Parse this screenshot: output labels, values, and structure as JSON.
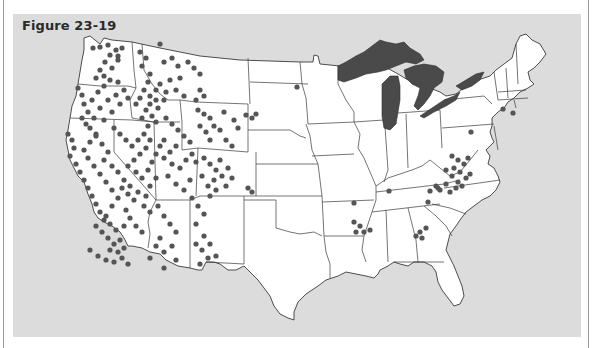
{
  "figure": {
    "title": "Figure 23-19"
  },
  "map": {
    "type": "dot-density map",
    "region": "Contiguous United States",
    "colors": {
      "panel_background": "#dcdcdc",
      "land": "#ffffff",
      "borders": "#3a3a3a",
      "great_lakes": "#4a4a4a",
      "dots": "#555555"
    },
    "great_lakes": [
      "Lake Superior",
      "Lake Michigan",
      "Lake Huron",
      "Lake Erie",
      "Lake Ontario"
    ],
    "dot_clusters": [
      {
        "region": "Washington",
        "points": [
          [
            93,
            48
          ],
          [
            100,
            47
          ],
          [
            108,
            45
          ],
          [
            116,
            50
          ],
          [
            110,
            55
          ],
          [
            118,
            56
          ],
          [
            105,
            62
          ],
          [
            112,
            68
          ],
          [
            118,
            60
          ],
          [
            122,
            48
          ],
          [
            100,
            70
          ],
          [
            96,
            78
          ],
          [
            104,
            76
          ]
        ]
      },
      {
        "region": "Oregon",
        "points": [
          [
            78,
            88
          ],
          [
            82,
            95
          ],
          [
            84,
            104
          ],
          [
            88,
            112
          ],
          [
            82,
            118
          ],
          [
            86,
            124
          ],
          [
            92,
            100
          ],
          [
            98,
            92
          ],
          [
            104,
            86
          ],
          [
            110,
            80
          ],
          [
            118,
            82
          ],
          [
            124,
            90
          ],
          [
            116,
            95
          ],
          [
            108,
            100
          ],
          [
            100,
            108
          ],
          [
            94,
            118
          ],
          [
            90,
            128
          ],
          [
            96,
            134
          ],
          [
            104,
            120
          ],
          [
            112,
            112
          ],
          [
            120,
            104
          ],
          [
            128,
            98
          ]
        ]
      },
      {
        "region": "Idaho",
        "points": [
          [
            140,
            52
          ],
          [
            146,
            58
          ],
          [
            142,
            66
          ],
          [
            150,
            74
          ],
          [
            148,
            82
          ],
          [
            144,
            90
          ],
          [
            150,
            96
          ],
          [
            156,
            90
          ],
          [
            160,
            84
          ],
          [
            156,
            100
          ],
          [
            150,
            104
          ],
          [
            146,
            110
          ],
          [
            152,
            116
          ],
          [
            158,
            108
          ],
          [
            164,
            100
          ],
          [
            140,
            98
          ],
          [
            136,
            104
          ],
          [
            142,
            118
          ],
          [
            156,
            122
          ],
          [
            148,
            126
          ]
        ]
      },
      {
        "region": "Montana",
        "points": [
          [
            160,
            44
          ],
          [
            164,
            62
          ],
          [
            172,
            58
          ],
          [
            178,
            66
          ],
          [
            188,
            62
          ],
          [
            194,
            68
          ],
          [
            200,
            74
          ],
          [
            180,
            78
          ],
          [
            170,
            80
          ],
          [
            176,
            90
          ],
          [
            184,
            96
          ],
          [
            166,
            92
          ],
          [
            200,
            90
          ],
          [
            204,
            96
          ],
          [
            196,
            100
          ]
        ]
      },
      {
        "region": "Wyoming",
        "points": [
          [
            198,
            110
          ],
          [
            204,
            114
          ],
          [
            210,
            118
          ],
          [
            214,
            126
          ],
          [
            220,
            130
          ],
          [
            206,
            132
          ],
          [
            200,
            126
          ],
          [
            224,
            112
          ],
          [
            234,
            120
          ],
          [
            238,
            128
          ],
          [
            226,
            140
          ],
          [
            232,
            146
          ],
          [
            210,
            140
          ]
        ]
      },
      {
        "region": "California",
        "points": [
          [
            68,
            134
          ],
          [
            72,
            140
          ],
          [
            74,
            148
          ],
          [
            70,
            156
          ],
          [
            76,
            164
          ],
          [
            80,
            172
          ],
          [
            84,
            180
          ],
          [
            88,
            188
          ],
          [
            92,
            196
          ],
          [
            96,
            204
          ],
          [
            100,
            212
          ],
          [
            104,
            220
          ],
          [
            96,
            226
          ],
          [
            102,
            232
          ],
          [
            108,
            238
          ],
          [
            114,
            244
          ],
          [
            110,
            250
          ],
          [
            118,
            252
          ],
          [
            124,
            248
          ],
          [
            120,
            240
          ],
          [
            116,
            230
          ],
          [
            110,
            224
          ],
          [
            106,
            216
          ],
          [
            112,
            206
          ],
          [
            118,
            198
          ],
          [
            112,
            190
          ],
          [
            106,
            182
          ],
          [
            100,
            174
          ],
          [
            94,
            166
          ],
          [
            88,
            158
          ],
          [
            84,
            150
          ],
          [
            90,
            142
          ],
          [
            96,
            136
          ],
          [
            102,
            144
          ],
          [
            108,
            152
          ],
          [
            104,
            160
          ],
          [
            112,
            166
          ],
          [
            118,
            172
          ],
          [
            124,
            180
          ],
          [
            122,
            188
          ],
          [
            128,
            194
          ],
          [
            134,
            200
          ],
          [
            126,
            210
          ],
          [
            130,
            218
          ],
          [
            136,
            226
          ],
          [
            142,
            232
          ],
          [
            124,
            226
          ],
          [
            90,
            250
          ],
          [
            98,
            256
          ],
          [
            106,
            260
          ],
          [
            114,
            262
          ],
          [
            122,
            258
          ],
          [
            128,
            264
          ]
        ]
      },
      {
        "region": "Nevada",
        "points": [
          [
            114,
            128
          ],
          [
            120,
            134
          ],
          [
            126,
            140
          ],
          [
            132,
            146
          ],
          [
            138,
            140
          ],
          [
            144,
            134
          ],
          [
            150,
            140
          ],
          [
            146,
            148
          ],
          [
            140,
            154
          ],
          [
            134,
            160
          ],
          [
            128,
            166
          ],
          [
            136,
            172
          ],
          [
            142,
            178
          ],
          [
            148,
            170
          ],
          [
            152,
            162
          ],
          [
            156,
            154
          ],
          [
            160,
            146
          ],
          [
            164,
            140
          ],
          [
            130,
            186
          ],
          [
            138,
            192
          ],
          [
            146,
            196
          ],
          [
            150,
            186
          ],
          [
            156,
            178
          ],
          [
            144,
            206
          ]
        ]
      },
      {
        "region": "Utah",
        "points": [
          [
            166,
            118
          ],
          [
            172,
            124
          ],
          [
            178,
            130
          ],
          [
            184,
            136
          ],
          [
            190,
            142
          ],
          [
            176,
            146
          ],
          [
            170,
            152
          ],
          [
            164,
            158
          ],
          [
            172,
            164
          ],
          [
            180,
            168
          ],
          [
            186,
            160
          ],
          [
            192,
            154
          ],
          [
            196,
            162
          ],
          [
            168,
            176
          ],
          [
            176,
            184
          ],
          [
            184,
            190
          ],
          [
            190,
            180
          ]
        ]
      },
      {
        "region": "Colorado",
        "points": [
          [
            204,
            158
          ],
          [
            210,
            164
          ],
          [
            216,
            170
          ],
          [
            222,
            176
          ],
          [
            214,
            180
          ],
          [
            208,
            186
          ],
          [
            202,
            176
          ],
          [
            220,
            160
          ],
          [
            228,
            168
          ],
          [
            232,
            178
          ],
          [
            226,
            186
          ],
          [
            216,
            190
          ],
          [
            210,
            196
          ],
          [
            248,
            188
          ],
          [
            252,
            192
          ]
        ]
      },
      {
        "region": "Arizona",
        "points": [
          [
            150,
            212
          ],
          [
            158,
            206
          ],
          [
            164,
            216
          ],
          [
            170,
            224
          ],
          [
            176,
            232
          ],
          [
            160,
            238
          ],
          [
            156,
            246
          ],
          [
            164,
            252
          ],
          [
            172,
            246
          ],
          [
            176,
            260
          ],
          [
            164,
            268
          ],
          [
            150,
            258
          ]
        ]
      },
      {
        "region": "New Mexico",
        "points": [
          [
            192,
            198
          ],
          [
            198,
            206
          ],
          [
            204,
            214
          ],
          [
            196,
            224
          ],
          [
            204,
            236
          ],
          [
            210,
            244
          ],
          [
            202,
            250
          ],
          [
            196,
            244
          ],
          [
            208,
            258
          ],
          [
            216,
            256
          ],
          [
            200,
            264
          ]
        ]
      },
      {
        "region": "Dakotas",
        "points": [
          [
            297,
            87
          ],
          [
            246,
            115
          ],
          [
            252,
            118
          ],
          [
            256,
            114
          ]
        ]
      },
      {
        "region": "Arkansas",
        "points": [
          [
            354,
            222
          ],
          [
            360,
            226
          ],
          [
            364,
            232
          ],
          [
            370,
            230
          ],
          [
            356,
            232
          ]
        ]
      },
      {
        "region": "Kentucky/Tennessee",
        "points": [
          [
            389,
            191
          ],
          [
            354,
            203
          ],
          [
            430,
            191
          ],
          [
            438,
            188
          ],
          [
            428,
            202
          ]
        ]
      },
      {
        "region": "Georgia",
        "points": [
          [
            420,
            232
          ],
          [
            426,
            228
          ],
          [
            422,
            238
          ],
          [
            416,
            236
          ]
        ]
      },
      {
        "region": "West Virginia/Virginia",
        "points": [
          [
            452,
            156
          ],
          [
            458,
            160
          ],
          [
            454,
            168
          ],
          [
            460,
            172
          ],
          [
            464,
            164
          ],
          [
            466,
            178
          ],
          [
            458,
            182
          ],
          [
            452,
            176
          ],
          [
            446,
            184
          ],
          [
            440,
            190
          ],
          [
            450,
            192
          ],
          [
            456,
            188
          ],
          [
            462,
            186
          ],
          [
            470,
            174
          ],
          [
            468,
            158
          ],
          [
            446,
            170
          ],
          [
            436,
            186
          ]
        ]
      },
      {
        "region": "Pennsylvania/Northeast",
        "points": [
          [
            471,
            132
          ],
          [
            503,
            109
          ],
          [
            513,
            113
          ]
        ]
      }
    ]
  }
}
